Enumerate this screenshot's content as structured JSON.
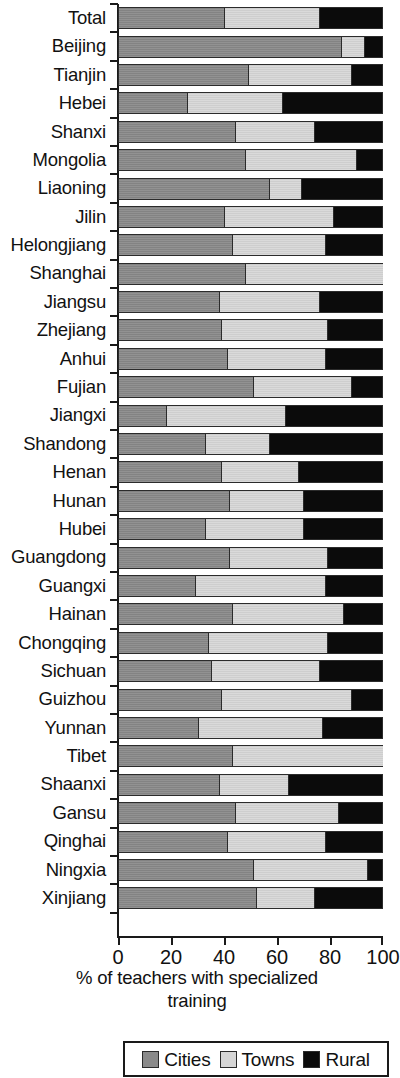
{
  "chart_data": {
    "type": "bar",
    "subtype": "stacked-horizontal-100pct",
    "title": "",
    "xlabel": "% of teachers with specialized training",
    "ylabel": "",
    "xlim": [
      0,
      100
    ],
    "xticks": [
      0,
      20,
      40,
      60,
      80,
      100
    ],
    "xtick_labels": [
      "0",
      "20",
      "40",
      "60",
      "80",
      "100"
    ],
    "grid": false,
    "legend_position": "bottom",
    "categories": [
      "Total",
      "Beijing",
      "Tianjin",
      "Hebei",
      "Shanxi",
      "Mongolia",
      "Liaoning",
      "Jilin",
      "Helongjiang",
      "Shanghai",
      "Jiangsu",
      "Zhejiang",
      "Anhui",
      "Fujian",
      "Jiangxi",
      "Shandong",
      "Henan",
      "Hunan",
      "Hubei",
      "Guangdong",
      "Guangxi",
      "Hainan",
      "Chongqing",
      "Sichuan",
      "Guizhou",
      "Yunnan",
      "Tibet",
      "Shaanxi",
      "Gansu",
      "Qinghai",
      "Ningxia",
      "Xinjiang"
    ],
    "series": [
      {
        "name": "Cities",
        "color": "#8a8a8a",
        "values": [
          40,
          84,
          49,
          26,
          44,
          48,
          57,
          40,
          43,
          48,
          38,
          39,
          41,
          51,
          18,
          33,
          39,
          42,
          33,
          42,
          29,
          43,
          34,
          35,
          39,
          30,
          43,
          38,
          44,
          41,
          51,
          52
        ]
      },
      {
        "name": "Towns",
        "color": "#d6d6d6",
        "values": [
          36,
          9,
          39,
          36,
          30,
          42,
          12,
          41,
          35,
          52,
          38,
          40,
          37,
          37,
          45,
          24,
          29,
          28,
          37,
          37,
          49,
          42,
          45,
          41,
          49,
          47,
          57,
          26,
          39,
          37,
          43,
          22
        ]
      },
      {
        "name": "Rural",
        "color": "#0b0b0b",
        "values": [
          24,
          7,
          12,
          38,
          26,
          10,
          31,
          19,
          22,
          0,
          24,
          21,
          22,
          12,
          37,
          43,
          32,
          30,
          30,
          21,
          22,
          15,
          21,
          24,
          12,
          23,
          0,
          36,
          17,
          22,
          6,
          26
        ]
      }
    ]
  },
  "axis_title": {
    "line1": "% of teachers with specialized",
    "line2": "training"
  },
  "legend": {
    "items": [
      {
        "label": "Cities",
        "color": "#8a8a8a"
      },
      {
        "label": "Towns",
        "color": "#d6d6d6"
      },
      {
        "label": "Rural",
        "color": "#0b0b0b"
      }
    ]
  }
}
